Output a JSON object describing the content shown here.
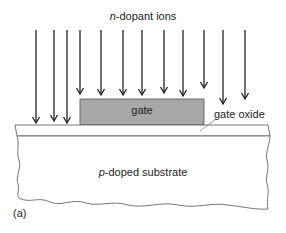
{
  "figure": {
    "title_italic": "n",
    "title_rest": "-dopant ions",
    "gate_label": "gate",
    "oxide_label": "gate oxide",
    "substrate_italic": "p",
    "substrate_rest": "-doped substrate",
    "panel_label": "(a)"
  },
  "colors": {
    "gate_fill": "#a8a8a8",
    "line": "#333333",
    "background": "#ffffff"
  },
  "arrows": [
    {
      "x": 36,
      "tip": 123
    },
    {
      "x": 54,
      "tip": 121
    },
    {
      "x": 67,
      "tip": 123
    },
    {
      "x": 80,
      "tip": 94
    },
    {
      "x": 101,
      "tip": 95
    },
    {
      "x": 123,
      "tip": 95
    },
    {
      "x": 142,
      "tip": 95
    },
    {
      "x": 164,
      "tip": 93
    },
    {
      "x": 183,
      "tip": 96
    },
    {
      "x": 204,
      "tip": 88
    },
    {
      "x": 223,
      "tip": 104
    },
    {
      "x": 245,
      "tip": 99
    }
  ]
}
